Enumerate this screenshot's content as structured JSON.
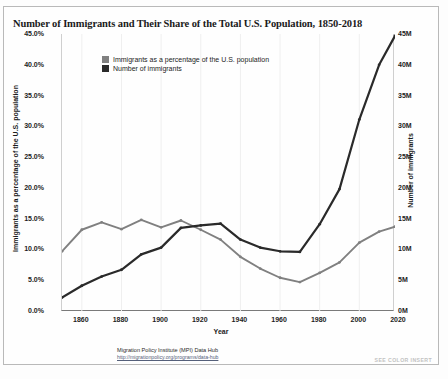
{
  "chart_title": "Number of Immigrants and Their Share of the Total U.S. Population, 1850-2018",
  "axis": {
    "x_title": "Year",
    "y_left_title": "Immigrants as a percentage of the U.S. population",
    "y_right_title": "Number of immigrants",
    "y_left_ticks": [
      "45.0%",
      "40.0%",
      "35.0%",
      "30.0%",
      "25.0%",
      "20.0%",
      "15.0%",
      "10.0%",
      "5.0%",
      "0.0%"
    ],
    "y_right_ticks": [
      "45M",
      "40M",
      "35M",
      "30M",
      "25M",
      "20M",
      "15M",
      "10M",
      "5M",
      "0M"
    ],
    "x_ticks": [
      "1860",
      "1880",
      "1900",
      "1920",
      "1940",
      "1960",
      "1980",
      "2000",
      "2020"
    ]
  },
  "legend": {
    "items": [
      {
        "label": "Immigrants as a percentage of the U.S. population",
        "color": "#808080"
      },
      {
        "label": "Number of immigrants",
        "color": "#2a2a2a"
      }
    ]
  },
  "source": {
    "line1": "Migration Policy Institute (MPI) Data Hub",
    "line2": "http://migrationpolicy.org/programs/data-hub"
  },
  "corner_note": "SEE COLOR INSERT",
  "chart_data": {
    "type": "line",
    "title": "Number of Immigrants and Their Share of the Total U.S. Population, 1850-2018",
    "xlabel": "Year",
    "ylabel": "Immigrants as a percentage of the U.S. population",
    "y2label": "Number of immigrants",
    "xlim": [
      1850,
      2018
    ],
    "ylim": [
      0,
      45
    ],
    "y2lim": [
      0,
      45
    ],
    "grid": "vertical-only",
    "legend_position": "top-left-inside",
    "x": [
      1850,
      1860,
      1870,
      1880,
      1890,
      1900,
      1910,
      1920,
      1930,
      1940,
      1950,
      1960,
      1970,
      1980,
      1990,
      2000,
      2010,
      2018
    ],
    "series": [
      {
        "name": "Immigrants as a percentage of the U.S. population",
        "color": "#808080",
        "unit": "percent",
        "axis": "left",
        "values": [
          9.7,
          13.2,
          14.4,
          13.3,
          14.8,
          13.6,
          14.7,
          13.2,
          11.6,
          8.8,
          6.9,
          5.4,
          4.7,
          6.2,
          7.9,
          11.1,
          12.9,
          13.7
        ]
      },
      {
        "name": "Number of immigrants",
        "color": "#2a2a2a",
        "unit": "millions",
        "axis": "right",
        "values": [
          2.2,
          4.1,
          5.6,
          6.7,
          9.2,
          10.3,
          13.5,
          13.9,
          14.2,
          11.6,
          10.3,
          9.7,
          9.6,
          14.1,
          19.8,
          31.1,
          40.0,
          44.7
        ]
      }
    ]
  }
}
